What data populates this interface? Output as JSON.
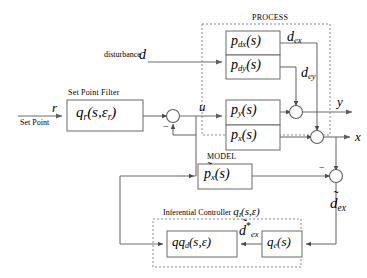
{
  "diagram": {
    "title_process": "PROCESS",
    "title_model": "MODEL",
    "title_setpoint_filter": "Set Point Filter",
    "title_inferential_controller": "Inferential Controller",
    "inferential_controller_symbol": "q",
    "inferential_controller_sub": "I",
    "inferential_controller_args": "(s,ε)",
    "blocks": {
      "setpoint_filter": {
        "name": "q",
        "sub": "r",
        "args": "(s,ε",
        "args_sub": "r",
        "args_close": ")"
      },
      "p_dx": {
        "name": "p",
        "sub": "dx",
        "args": "(s)"
      },
      "p_dy": {
        "name": "p",
        "sub": "dy",
        "args": "(s)"
      },
      "p_y": {
        "name": "p",
        "sub": "y",
        "args": "(s)"
      },
      "p_x": {
        "name": "p",
        "sub": "x",
        "args": "(s)"
      },
      "model_px": {
        "name": "p",
        "sub": "x",
        "args": "(s)",
        "tilde": "̃"
      },
      "qqd": {
        "name": "qq",
        "sub": "d",
        "args": "(s,ε)"
      },
      "qe": {
        "name": "q",
        "sub": "e",
        "args": "(s)"
      }
    },
    "signals": {
      "r": "r",
      "set_point": "Set Point",
      "disturbance_word": "disturbance",
      "d": "d",
      "u": "u",
      "d_ex": {
        "base": "d",
        "sub": "ex"
      },
      "d_ey": {
        "base": "d",
        "sub": "ey"
      },
      "y": "y",
      "x": "x",
      "d_tilde_ex": {
        "base": "d",
        "sub": "ex",
        "tilde": "̃"
      },
      "d_tilde_star_ex": {
        "base": "d",
        "sub": "ex",
        "tilde": "̃",
        "star": "*"
      }
    },
    "signs": {
      "sum_u": "−",
      "sum_model": "−"
    },
    "colors": {
      "line": "#6e6e6e",
      "block_border": "#5a5a5a",
      "dashed_border": "#7a7a7a",
      "text": "#000000",
      "background": "#ffffff"
    }
  }
}
